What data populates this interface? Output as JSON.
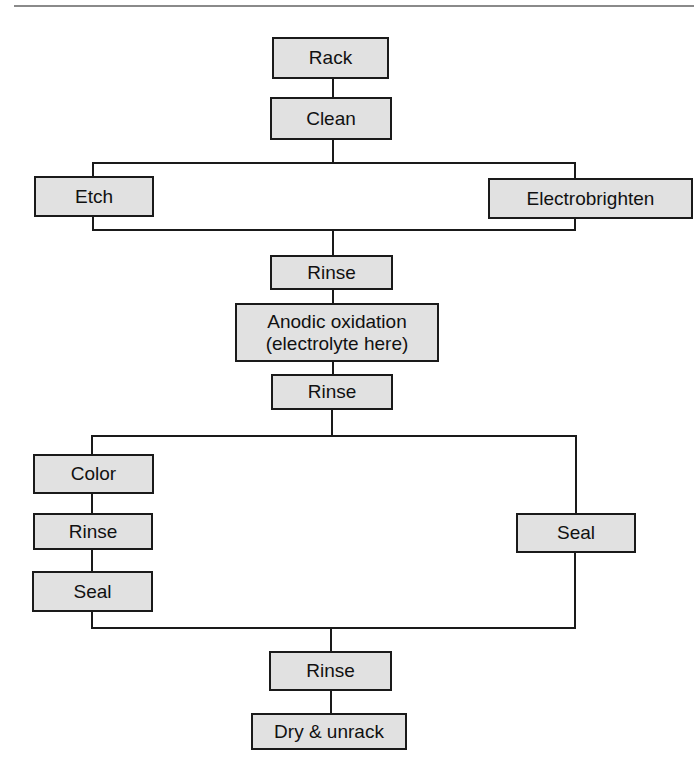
{
  "diagram": {
    "colors": {
      "box_fill": "#e1e1e1",
      "line": "#1a1a1a",
      "rule": "#8a8a8a"
    },
    "nodes": {
      "rack": "Rack",
      "clean": "Clean",
      "etch": "Etch",
      "electrobrighten": "Electrobrighten",
      "rinse1": "Rinse",
      "anodic": "Anodic oxidation\n(electrolyte here)",
      "rinse2": "Rinse",
      "color": "Color",
      "rinse_left": "Rinse",
      "seal_left": "Seal",
      "seal_right": "Seal",
      "rinse3": "Rinse",
      "dry": "Dry & unrack"
    },
    "edges": [
      [
        "rack",
        "clean"
      ],
      [
        "clean",
        "etch"
      ],
      [
        "clean",
        "electrobrighten"
      ],
      [
        "etch",
        "rinse1"
      ],
      [
        "electrobrighten",
        "rinse1"
      ],
      [
        "rinse1",
        "anodic"
      ],
      [
        "anodic",
        "rinse2"
      ],
      [
        "rinse2",
        "color"
      ],
      [
        "color",
        "rinse_left"
      ],
      [
        "rinse_left",
        "seal_left"
      ],
      [
        "rinse2",
        "seal_right"
      ],
      [
        "seal_left",
        "rinse3"
      ],
      [
        "seal_right",
        "rinse3"
      ],
      [
        "rinse3",
        "dry"
      ]
    ]
  }
}
